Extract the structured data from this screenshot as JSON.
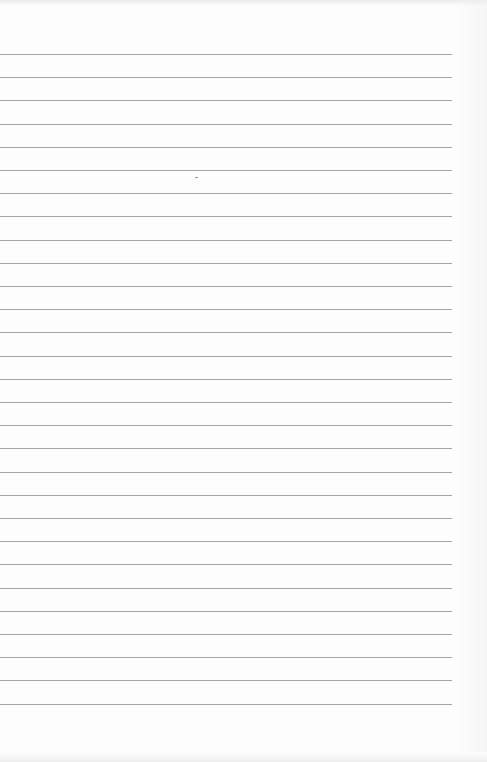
{
  "page": {
    "type": "blank-lined-paper",
    "rule_color": "#a4a4a4",
    "background_color": "#fdfdfd",
    "rule_count": 29,
    "first_rule_y": 54,
    "rule_spacing": 23.2,
    "rule_left": 0,
    "rule_right": 452,
    "text": ""
  }
}
